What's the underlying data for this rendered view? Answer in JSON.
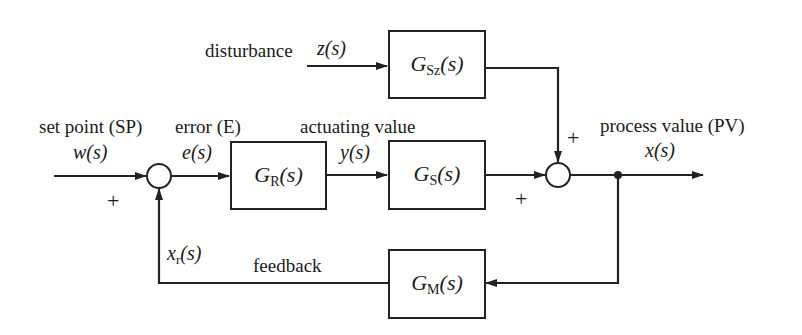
{
  "diagram": {
    "type": "closed-loop control block diagram",
    "signals": {
      "setpoint_label": "set point (SP)",
      "setpoint_var": "w(s)",
      "error_label": "error (E)",
      "error_var": "e(s)",
      "actuating_label": "actuating value",
      "actuating_var": "y(s)",
      "disturbance_label": "disturbance",
      "disturbance_var": "z(s)",
      "process_label": "process value (PV)",
      "process_var": "x(s)",
      "feedback_label": "feedback",
      "feedback_var_base": "x",
      "feedback_var_sub": "r",
      "feedback_var_arg": "(s)"
    },
    "blocks": {
      "controller": {
        "base": "G",
        "sub": "R",
        "arg": "(s)"
      },
      "plant": {
        "base": "G",
        "sub": "S",
        "arg": "(s)"
      },
      "disturbance": {
        "base": "G",
        "sub": "Sz",
        "arg": "(s)"
      },
      "measurement": {
        "base": "G",
        "sub": "M",
        "arg": "(s)"
      }
    },
    "signs": {
      "sum1_setpoint": "+",
      "sum2_plant": "+",
      "sum2_disturbance": "+"
    }
  }
}
